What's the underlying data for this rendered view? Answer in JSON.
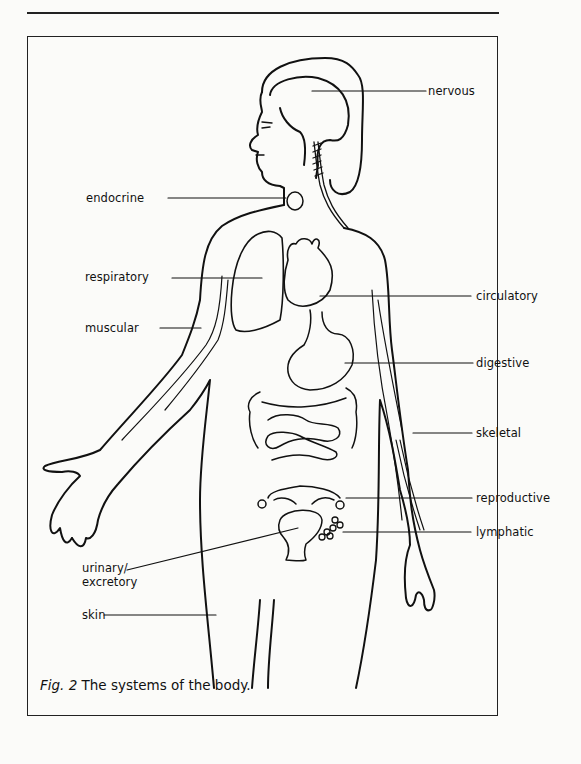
{
  "figure": {
    "caption_prefix": "Fig. 2",
    "caption_text": " The systems of the body."
  },
  "labels": {
    "nervous": "nervous",
    "endocrine": "endocrine",
    "respiratory": "respiratory",
    "circulatory": "circulatory",
    "muscular": "muscular",
    "digestive": "digestive",
    "skeletal": "skeletal",
    "reproductive": "reproductive",
    "lymphatic": "lymphatic",
    "urinary_line1": "urinary/",
    "urinary_line2": "excretory",
    "skin": "skin"
  }
}
